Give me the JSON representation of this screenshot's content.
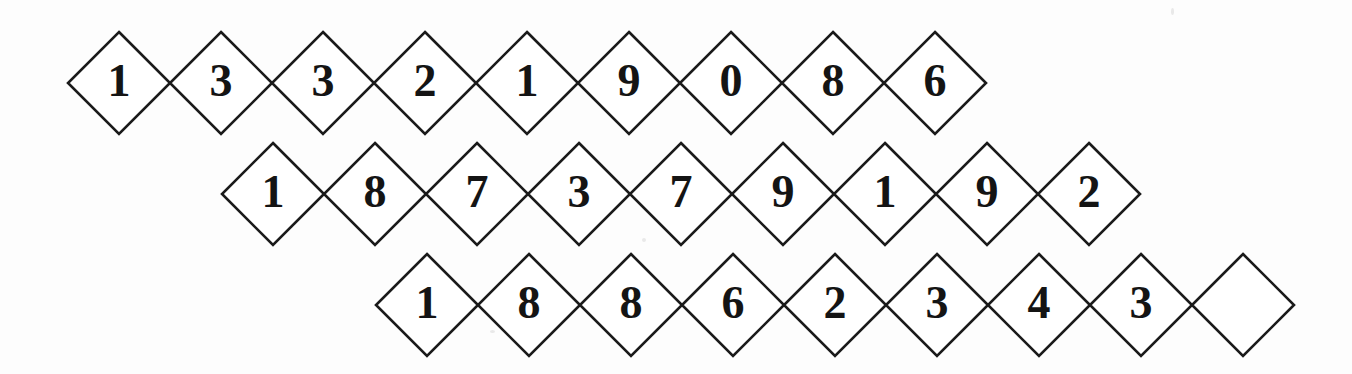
{
  "canvas": {
    "width": 1352,
    "height": 374,
    "background_color": "#fdfdfd",
    "stroke_color": "#1a1a1a",
    "digit_color": "#141414",
    "title": "Lattice of diamond cells containing digits"
  },
  "geometry": {
    "cell_half_width": 51,
    "cell_half_height": 51,
    "row_x_offset": 154,
    "row_y_offset": 111,
    "first_row_center_x": 119,
    "first_row_center_y": 83
  },
  "rows": [
    {
      "row_name": "row-1",
      "cells": [
        {
          "value": "1"
        },
        {
          "value": "3"
        },
        {
          "value": "3"
        },
        {
          "value": "2"
        },
        {
          "value": "1"
        },
        {
          "value": "9"
        },
        {
          "value": "0"
        },
        {
          "value": "8"
        },
        {
          "value": "6"
        }
      ]
    },
    {
      "row_name": "row-2",
      "cells": [
        {
          "value": "1"
        },
        {
          "value": "8"
        },
        {
          "value": "7"
        },
        {
          "value": "3"
        },
        {
          "value": "7"
        },
        {
          "value": "9"
        },
        {
          "value": "1"
        },
        {
          "value": "9"
        },
        {
          "value": "2"
        }
      ]
    },
    {
      "row_name": "row-3",
      "cells": [
        {
          "value": "1"
        },
        {
          "value": "8"
        },
        {
          "value": "8"
        },
        {
          "value": "6"
        },
        {
          "value": "2"
        },
        {
          "value": "3"
        },
        {
          "value": "4"
        },
        {
          "value": "3"
        },
        {
          "value": ""
        }
      ]
    }
  ]
}
